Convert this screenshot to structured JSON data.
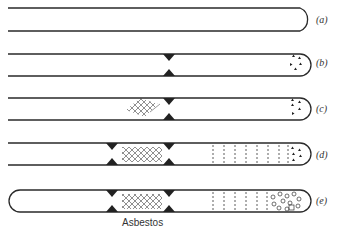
{
  "diagram": {
    "type": "test-tube sequence",
    "stages": [
      {
        "label": "(a)",
        "left_closed": false,
        "constrictions": [],
        "cross_hatch": false,
        "dashed_section": false,
        "contents": "none"
      },
      {
        "label": "(b)",
        "left_closed": false,
        "constrictions": [
          "middle"
        ],
        "cross_hatch": false,
        "dashed_section": false,
        "contents": "triangles"
      },
      {
        "label": "(c)",
        "left_closed": false,
        "constrictions": [
          "middle"
        ],
        "cross_hatch": "left-of-middle",
        "dashed_section": false,
        "contents": "triangles"
      },
      {
        "label": "(d)",
        "left_closed": false,
        "constrictions": [
          "left",
          "middle"
        ],
        "cross_hatch": "between",
        "dashed_section": true,
        "contents": "triangles"
      },
      {
        "label": "(e)",
        "left_closed": true,
        "constrictions": [
          "left",
          "middle"
        ],
        "cross_hatch": "between",
        "dashed_section": true,
        "contents": "circles"
      }
    ],
    "caption": "Asbestos",
    "colors": {
      "line": "#2a2a2a",
      "background": "#ffffff"
    }
  }
}
